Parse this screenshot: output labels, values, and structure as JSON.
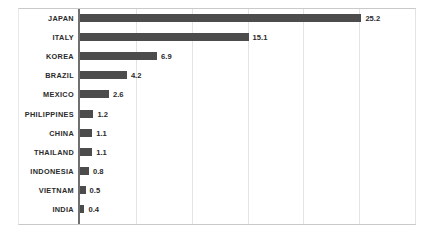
{
  "chart_data": {
    "type": "bar",
    "orientation": "horizontal",
    "title": "",
    "subtitle": "",
    "xlabel": "",
    "ylabel": "",
    "categories": [
      "JAPAN",
      "ITALY",
      "KOREA",
      "BRAZIL",
      "MEXICO",
      "PHILIPPINES",
      "CHINA",
      "THAILAND",
      "INDONESIA",
      "VIETNAM",
      "INDIA"
    ],
    "values": [
      25.2,
      15.1,
      6.9,
      4.2,
      2.6,
      1.2,
      1.1,
      1.1,
      0.8,
      0.5,
      0.4
    ],
    "value_labels": [
      "25.2",
      "15.1",
      "6.9",
      "4.2",
      "2.6",
      "1.2",
      "1.1",
      "1.1",
      "0.8",
      "0.5",
      "0.4"
    ],
    "xlim": [
      0,
      30
    ],
    "gridline_values": [
      5,
      10,
      15,
      20,
      25,
      30
    ],
    "grid": true,
    "tick_labels": [],
    "legend": [],
    "legend_position": "none",
    "annotations": [],
    "series": [
      {
        "name": "",
        "values": [
          25.2,
          15.1,
          6.9,
          4.2,
          2.6,
          1.2,
          1.1,
          1.1,
          0.8,
          0.5,
          0.4
        ],
        "color": "#4c4c4c"
      }
    ]
  },
  "style": {
    "bar_color": "#4c4c4c",
    "axis_color": "#6f6f6f",
    "grid_color": "#e3e3e3",
    "frame_color": "#c9c9c9",
    "label_color": "#2b2b2b",
    "background": "#ffffff"
  }
}
